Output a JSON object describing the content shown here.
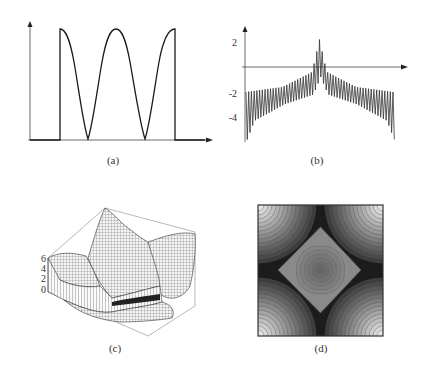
{
  "figure": {
    "panels": [
      {
        "id": "a",
        "caption": "(a)",
        "kind": "line plot"
      },
      {
        "id": "b",
        "caption": "(b)",
        "kind": "line plot"
      },
      {
        "id": "c",
        "caption": "(c)",
        "kind": "3d surface plot"
      },
      {
        "id": "d",
        "caption": "(d)",
        "kind": "contour / density plot"
      }
    ]
  },
  "chart_data": [
    {
      "panel": "a",
      "type": "line",
      "title": "",
      "xlabel": "",
      "ylabel": "",
      "description": "Windowed raised-cosine signal: zero, jump to max, cosine oscillation with 2 troughs to zero and 1 interior peak, drop back to zero",
      "x": [
        0,
        0.17,
        0.17,
        0.32,
        0.48,
        0.63,
        0.79,
        0.79,
        1.0
      ],
      "y": [
        0,
        0,
        1,
        0,
        1,
        0,
        1,
        0,
        0
      ],
      "yticks": [],
      "xticks": [],
      "grid": false,
      "axes_arrows": true
    },
    {
      "panel": "b",
      "type": "line",
      "title": "",
      "xlabel": "",
      "ylabel": "",
      "description": "Dense oscillating signal symmetric about center; baseline near -2 at edges rising toward 0 near center with central spikes reaching ~2; edge spikes dip to ~-5.5",
      "yticks": [
        "2",
        "-2",
        "-4"
      ],
      "ytick_values": [
        2,
        -2,
        -4
      ],
      "ylim": [
        -5.8,
        2.5
      ],
      "envelope_upper": {
        "x": [
          0,
          0.25,
          0.45,
          0.5,
          0.55,
          0.75,
          1.0
        ],
        "y": [
          -2,
          -1.6,
          -0.4,
          2.2,
          -0.4,
          -1.6,
          -2
        ]
      },
      "envelope_lower": {
        "x": [
          0,
          0.05,
          0.25,
          0.45,
          0.5,
          0.55,
          0.75,
          0.95,
          1.0
        ],
        "y": [
          -5.8,
          -4.3,
          -3.0,
          -2.2,
          -0.8,
          -2.2,
          -3.0,
          -4.3,
          -5.8
        ]
      },
      "grid": false,
      "axes_arrows": true
    },
    {
      "panel": "c",
      "type": "surface",
      "title": "",
      "zticks": [
        "6",
        "4",
        "2",
        "0"
      ],
      "ztick_values": [
        6,
        4,
        2,
        0
      ],
      "zlim": [
        0,
        6
      ],
      "description": "3D wireframe mesh surface in bounding box; tall central ridge peaking near back, lower folds in front"
    },
    {
      "panel": "d",
      "type": "heatmap",
      "title": "",
      "description": "Grayscale contour map: central diamond of mid-gray concentric contours, dark X-shaped bands toward edge midpoints, light concentric arcs in the four corners",
      "colormap": "grayscale"
    }
  ]
}
